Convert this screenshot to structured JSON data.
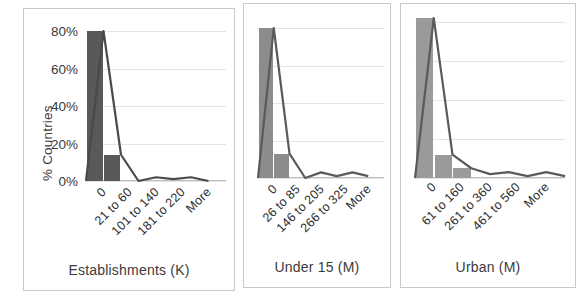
{
  "chart_data": [
    {
      "type": "bar",
      "title": "",
      "xlabel": "Establishments (K)",
      "ylabel": "% Countries",
      "categories": [
        "0",
        "21 to 60",
        "101 to 140",
        "181 to 220",
        "More"
      ],
      "tick_positions": [
        0,
        1,
        2,
        3,
        4
      ],
      "series": [
        {
          "name": "Frequency",
          "kind": "bar",
          "values": [
            80,
            14,
            0,
            0,
            0
          ],
          "color": "#595959"
        },
        {
          "name": "Cumulative",
          "kind": "line",
          "values": [
            0,
            80,
            14,
            0,
            2,
            1,
            2,
            0
          ],
          "color": "#4a4a4a"
        }
      ],
      "ylim": [
        0,
        80
      ],
      "yticks": [
        0,
        20,
        40,
        60,
        80
      ],
      "ytick_labels": [
        "0%",
        "20%",
        "40%",
        "60%",
        "80%"
      ],
      "grid": true,
      "legend": "none"
    },
    {
      "type": "bar",
      "title": "",
      "xlabel": "Under 15 (M)",
      "ylabel": "",
      "categories": [
        "0",
        "26 to 85",
        "146 to 205",
        "266 to 325",
        "More"
      ],
      "tick_positions": [
        0,
        1,
        2,
        3,
        4
      ],
      "series": [
        {
          "name": "Frequency",
          "kind": "bar",
          "values": [
            80,
            13,
            0,
            0,
            0
          ],
          "color": "#8c8c8c"
        },
        {
          "name": "Cumulative",
          "kind": "line",
          "values": [
            0,
            80,
            13,
            0,
            3,
            1,
            3,
            1
          ],
          "color": "#5a5a5a"
        }
      ],
      "ylim": [
        0,
        80
      ],
      "yticks": [
        0,
        20,
        40,
        60,
        80
      ],
      "ytick_labels": [
        "",
        "",
        "",
        "",
        ""
      ],
      "grid": true,
      "legend": "none"
    },
    {
      "type": "bar",
      "title": "",
      "xlabel": "Urban (M)",
      "ylabel": "",
      "categories": [
        "0",
        "61 to 160",
        "261 to 360",
        "461 to 560",
        "More"
      ],
      "tick_positions": [
        0,
        1,
        2,
        3,
        4
      ],
      "series": [
        {
          "name": "Frequency",
          "kind": "bar",
          "values": [
            82,
            12,
            5,
            0,
            0
          ],
          "color": "#9a9a9a"
        },
        {
          "name": "Cumulative",
          "kind": "line",
          "values": [
            0,
            82,
            12,
            5,
            2,
            3,
            1,
            3,
            1
          ],
          "color": "#5a5a5a"
        }
      ],
      "ylim": [
        0,
        80
      ],
      "yticks": [
        0,
        20,
        40,
        60,
        80
      ],
      "ytick_labels": [
        "",
        "",
        "",
        "",
        ""
      ],
      "grid": true,
      "legend": "none"
    }
  ],
  "panels": [
    {
      "id": "establishments",
      "axis_title": "Establishments (K)",
      "y_axis_title": "% Countries"
    },
    {
      "id": "under-15",
      "axis_title": "Under 15 (M)",
      "y_axis_title": ""
    },
    {
      "id": "urban",
      "axis_title": "Urban (M)",
      "y_axis_title": ""
    }
  ],
  "colors": {
    "bar_dark": "#595959",
    "bar_mid": "#8c8c8c",
    "bar_light": "#9a9a9a",
    "line": "#4a4a4a",
    "grid": "#e4e4e4",
    "panel_border": "#c9c9c9",
    "text": "#3b3b3b",
    "background": "#ffffff"
  }
}
